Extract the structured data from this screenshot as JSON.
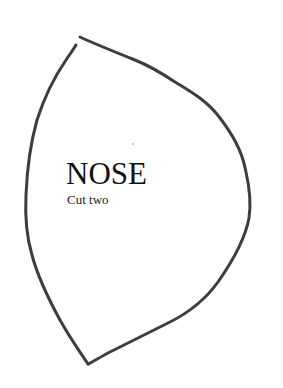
{
  "pattern": {
    "title": "NOSE",
    "instruction": "Cut two",
    "outline_color": "#3d3d3d",
    "background_color": "#ffffff"
  }
}
